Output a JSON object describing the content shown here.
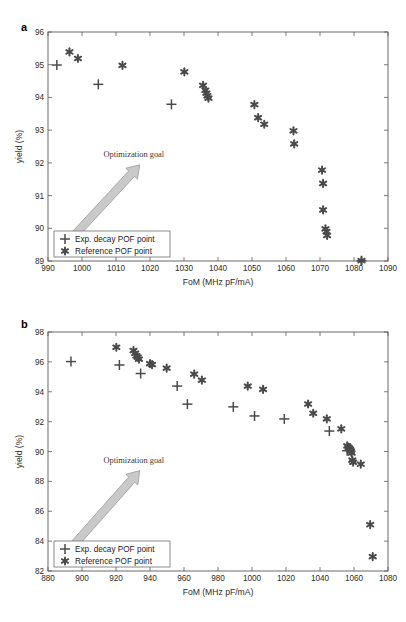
{
  "figure": {
    "background": "#ffffff",
    "marker_color": "#4a4a4a",
    "arrow_color": "#c9c9c9",
    "caption_partial": ""
  },
  "panels": [
    {
      "id": "a",
      "letter": "a",
      "annotation": "Optimization goal",
      "legend": [
        {
          "symbol": "plus",
          "label": "Exp. decay POF point"
        },
        {
          "symbol": "star",
          "label": "Reference POF point"
        }
      ],
      "chart_data": {
        "type": "scatter",
        "title": "",
        "xlabel": "FoM (MHz pF/mA)",
        "ylabel": "yield (%)",
        "xlim": [
          990,
          1090
        ],
        "ylim": [
          89,
          96
        ],
        "xticks": [
          990,
          1000,
          1010,
          1020,
          1030,
          1040,
          1050,
          1060,
          1070,
          1080,
          1090
        ],
        "yticks": [
          89,
          90,
          91,
          92,
          93,
          94,
          95,
          96
        ],
        "grid": false,
        "legend_position": "lower-left",
        "series": [
          {
            "name": "Exp. decay POF point",
            "marker": "plus",
            "points": [
              [
                992.6,
                94.99
              ],
              [
                1004.8,
                94.4
              ],
              [
                1026.3,
                93.79
              ],
              [
                1082.2,
                89.01
              ]
            ]
          },
          {
            "name": "Reference POF point",
            "marker": "star",
            "points": [
              [
                996.3,
                95.39
              ],
              [
                998.8,
                95.19
              ],
              [
                1011.9,
                94.98
              ],
              [
                1030.1,
                94.78
              ],
              [
                1035.6,
                94.37
              ],
              [
                1036.3,
                94.22
              ],
              [
                1036.6,
                94.13
              ],
              [
                1036.9,
                94.05
              ],
              [
                1037.2,
                93.98
              ],
              [
                1050.7,
                93.78
              ],
              [
                1051.8,
                93.38
              ],
              [
                1053.6,
                93.18
              ],
              [
                1062.2,
                92.98
              ],
              [
                1062.4,
                92.58
              ],
              [
                1070.6,
                91.78
              ],
              [
                1070.9,
                91.37
              ],
              [
                1070.9,
                90.56
              ],
              [
                1071.6,
                89.98
              ],
              [
                1071.9,
                89.9
              ],
              [
                1072.1,
                89.78
              ],
              [
                1082.2,
                89.01
              ]
            ]
          }
        ]
      }
    },
    {
      "id": "b",
      "letter": "b",
      "annotation": "Optimization goal",
      "legend": [
        {
          "symbol": "plus",
          "label": "Exp. decay POF point"
        },
        {
          "symbol": "star",
          "label": "Reference POF point"
        }
      ],
      "chart_data": {
        "type": "scatter",
        "title": "",
        "xlabel": "FoM (MHz pF/mA)",
        "ylabel": "yield (%)",
        "xlim": [
          880,
          1080
        ],
        "ylim": [
          82,
          98
        ],
        "xticks": [
          880,
          900,
          920,
          940,
          960,
          980,
          1000,
          1020,
          1040,
          1060,
          1080
        ],
        "yticks": [
          82,
          84,
          86,
          88,
          90,
          92,
          94,
          96,
          98
        ],
        "grid": false,
        "legend_position": "lower-left",
        "series": [
          {
            "name": "Exp. decay POF point",
            "marker": "plus",
            "points": [
              [
                893.5,
                96.02
              ],
              [
                922.0,
                95.79
              ],
              [
                934.5,
                95.22
              ],
              [
                956.0,
                94.38
              ],
              [
                962.0,
                93.17
              ],
              [
                989.0,
                92.99
              ],
              [
                1001.5,
                92.38
              ],
              [
                1019.0,
                92.18
              ],
              [
                1045.5,
                91.37
              ],
              [
                1056.0,
                90.05
              ]
            ]
          },
          {
            "name": "Reference POF point",
            "marker": "star",
            "points": [
              [
                920.2,
                96.98
              ],
              [
                930.3,
                96.76
              ],
              [
                931.3,
                96.58
              ],
              [
                932.0,
                96.4
              ],
              [
                932.8,
                96.32
              ],
              [
                933.5,
                96.18
              ],
              [
                940.0,
                95.88
              ],
              [
                941.2,
                95.82
              ],
              [
                949.8,
                95.58
              ],
              [
                966.0,
                95.18
              ],
              [
                970.5,
                94.78
              ],
              [
                997.5,
                94.38
              ],
              [
                1006.5,
                94.16
              ],
              [
                1033.0,
                93.18
              ],
              [
                1036.0,
                92.56
              ],
              [
                1044.0,
                92.18
              ],
              [
                1052.5,
                91.52
              ],
              [
                1056.0,
                90.38
              ],
              [
                1056.8,
                90.28
              ],
              [
                1057.3,
                90.2
              ],
              [
                1057.8,
                90.12
              ],
              [
                1058.2,
                90.02
              ],
              [
                1058.6,
                89.9
              ],
              [
                1059.0,
                89.42
              ],
              [
                1059.5,
                89.28
              ],
              [
                1064.0,
                89.15
              ],
              [
                1069.5,
                85.1
              ],
              [
                1071.0,
                82.96
              ]
            ]
          }
        ]
      }
    }
  ]
}
